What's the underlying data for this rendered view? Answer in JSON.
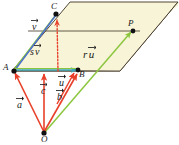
{
  "figure": {
    "colors": {
      "plane_fill": "#f7f4d8",
      "plane_edge": "#3f3222",
      "red_vector": "#e8402a",
      "dotted_red": "#e8402a",
      "green_line": "#8cc63f",
      "teal_line": "#3aa6b9",
      "blue_line": "#4a6fd0",
      "point_dot": "#111111",
      "background": "#ffffff"
    },
    "points": [
      {
        "id": "point-o",
        "label": "O",
        "x": 44,
        "y": 133
      },
      {
        "id": "point-a",
        "label": "A",
        "x": 14,
        "y": 71
      },
      {
        "id": "point-b",
        "label": "B",
        "x": 78,
        "y": 70
      },
      {
        "id": "point-c",
        "label": "C",
        "x": 56,
        "y": 14
      },
      {
        "id": "point-p",
        "label": "P",
        "x": 133,
        "y": 31
      }
    ],
    "point_labels": {
      "o": "O",
      "a": "A",
      "b": "B",
      "c": "C",
      "p": "P"
    },
    "vector_labels": {
      "a": "a",
      "b": "b",
      "c": "c",
      "u": "u",
      "v": "v",
      "ru_scalar": "r",
      "ru_vector": "u",
      "sv_scalar": "s",
      "sv_vector": "v"
    }
  }
}
